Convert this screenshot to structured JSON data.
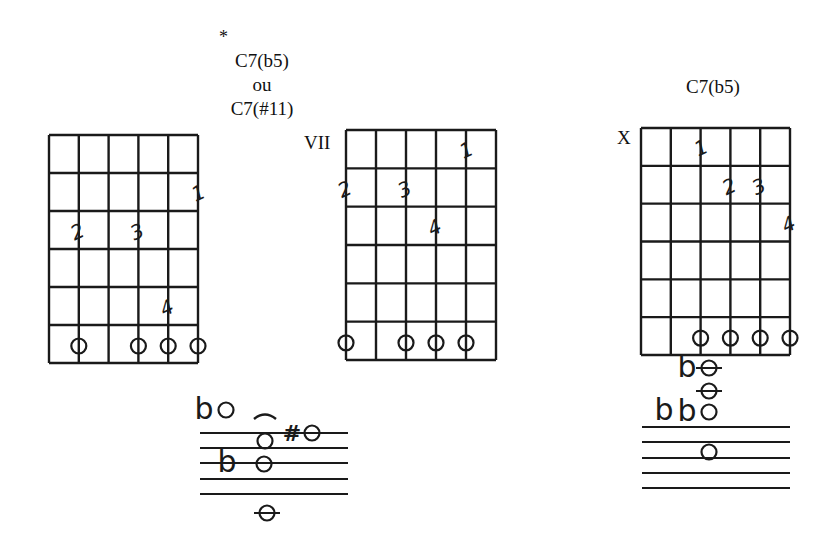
{
  "page": {
    "asterisk": "*",
    "chord_a": {
      "title_line1": "C7(b5)",
      "title_line2": "ou",
      "title_line3": "C7(#11)"
    },
    "chord_b": {
      "position_label": "VII"
    },
    "chord_c": {
      "title": "C7(b5)",
      "muted_label": "X"
    }
  },
  "diagrams": [
    {
      "id": "diagram-1",
      "grid": {
        "x": 49,
        "y": 135,
        "w": 149,
        "h": 228,
        "strings": 6,
        "frets": 6
      },
      "fingers": [
        {
          "label": "1",
          "string": 5,
          "fret": 2
        },
        {
          "label": "2",
          "string": 1,
          "fret": 3
        },
        {
          "label": "3",
          "string": 3,
          "fret": 3
        },
        {
          "label": "4",
          "string": 4,
          "fret": 5
        }
      ],
      "open_markers": [
        1,
        3,
        4,
        5
      ]
    },
    {
      "id": "diagram-2",
      "grid": {
        "x": 346,
        "y": 130,
        "w": 150,
        "h": 230,
        "strings": 6,
        "frets": 6
      },
      "position": "VII",
      "fingers": [
        {
          "label": "1",
          "string": 4,
          "fret": 1
        },
        {
          "label": "2",
          "string": 0,
          "fret": 2
        },
        {
          "label": "3",
          "string": 2,
          "fret": 2
        },
        {
          "label": "4",
          "string": 3,
          "fret": 3
        }
      ],
      "open_markers": [
        0,
        2,
        3,
        4
      ]
    },
    {
      "id": "diagram-3",
      "grid": {
        "x": 641,
        "y": 128,
        "w": 149,
        "h": 227,
        "strings": 6,
        "frets": 6
      },
      "muted": "X",
      "fingers": [
        {
          "label": "1",
          "string": 2,
          "fret": 1
        },
        {
          "label": "2",
          "string": 3,
          "fret": 2
        },
        {
          "label": "3",
          "string": 4,
          "fret": 2
        },
        {
          "label": "4",
          "string": 5,
          "fret": 3
        }
      ],
      "open_markers": [
        2,
        3,
        4,
        5
      ]
    }
  ],
  "staves": [
    {
      "id": "staff-1",
      "lines_y": [
        433,
        448,
        463,
        479,
        494
      ],
      "x1": 200,
      "x2": 348,
      "notes": [
        {
          "x": 226,
          "y": 410,
          "accidental": "b",
          "ledger": false
        },
        {
          "x": 265,
          "y": 441,
          "accidental": "",
          "ledger": false,
          "tie": true
        },
        {
          "x": 264,
          "y": 464,
          "accidental": "",
          "ledger": false
        },
        {
          "x": 231,
          "y": 464,
          "accidental_only": "b"
        },
        {
          "x": 312,
          "y": 433,
          "accidental": "#",
          "ledger": false
        },
        {
          "x": 267,
          "y": 513,
          "accidental": "",
          "ledger": true
        }
      ]
    },
    {
      "id": "staff-2",
      "lines_y": [
        427,
        442,
        458,
        473,
        488
      ],
      "x1": 642,
      "x2": 790,
      "notes": [
        {
          "x": 709,
          "y": 368,
          "accidental": "b",
          "ledger": true
        },
        {
          "x": 709,
          "y": 391,
          "accidental": "",
          "ledger": true
        },
        {
          "x": 709,
          "y": 412,
          "accidental": "b",
          "ledger": false
        },
        {
          "x": 709,
          "y": 452,
          "accidental": "",
          "ledger": false
        }
      ]
    }
  ]
}
